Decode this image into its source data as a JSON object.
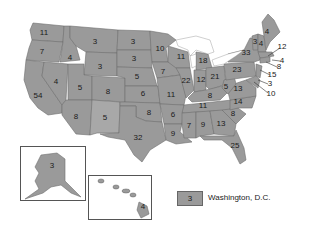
{
  "map": {
    "title": "",
    "type": "choropleth-number-labels",
    "fill_color": "#9a9a9a",
    "border_color": "#6e6e6e",
    "states": [
      {
        "name": "Washington",
        "value": "11",
        "x": 44,
        "y": 33
      },
      {
        "name": "Oregon",
        "value": "7",
        "x": 42,
        "y": 52
      },
      {
        "name": "California",
        "value": "54",
        "x": 38,
        "y": 96
      },
      {
        "name": "Idaho",
        "value": "4",
        "x": 70,
        "y": 58
      },
      {
        "name": "Nevada",
        "value": "4",
        "x": 56,
        "y": 82
      },
      {
        "name": "Montana",
        "value": "3",
        "x": 95,
        "y": 42
      },
      {
        "name": "Wyoming",
        "value": "3",
        "x": 100,
        "y": 67
      },
      {
        "name": "Utah",
        "value": "5",
        "x": 80,
        "y": 88
      },
      {
        "name": "Colorado",
        "value": "8",
        "x": 108,
        "y": 92
      },
      {
        "name": "Arizona",
        "value": "8",
        "x": 76,
        "y": 117
      },
      {
        "name": "New Mexico",
        "value": "5",
        "x": 105,
        "y": 118
      },
      {
        "name": "North Dakota",
        "value": "3",
        "x": 133,
        "y": 42
      },
      {
        "name": "South Dakota",
        "value": "3",
        "x": 134,
        "y": 59
      },
      {
        "name": "Nebraska",
        "value": "5",
        "x": 137,
        "y": 77
      },
      {
        "name": "Kansas",
        "value": "6",
        "x": 143,
        "y": 94
      },
      {
        "name": "Oklahoma",
        "value": "8",
        "x": 149,
        "y": 113
      },
      {
        "name": "Texas",
        "value": "32",
        "x": 138,
        "y": 138
      },
      {
        "name": "Minnesota",
        "value": "10",
        "x": 160,
        "y": 49
      },
      {
        "name": "Iowa",
        "value": "7",
        "x": 163,
        "y": 72
      },
      {
        "name": "Missouri",
        "value": "11",
        "x": 171,
        "y": 95
      },
      {
        "name": "Arkansas",
        "value": "6",
        "x": 173,
        "y": 115
      },
      {
        "name": "Louisiana",
        "value": "9",
        "x": 173,
        "y": 134
      },
      {
        "name": "Wisconsin",
        "value": "11",
        "x": 181,
        "y": 57
      },
      {
        "name": "Illinois",
        "value": "22",
        "x": 186,
        "y": 81
      },
      {
        "name": "Michigan",
        "value": "18",
        "x": 203,
        "y": 61
      },
      {
        "name": "Indiana",
        "value": "12",
        "x": 201,
        "y": 80
      },
      {
        "name": "Ohio",
        "value": "21",
        "x": 215,
        "y": 77
      },
      {
        "name": "Kentucky",
        "value": "8",
        "x": 210,
        "y": 96
      },
      {
        "name": "Tennessee",
        "value": "11",
        "x": 203,
        "y": 106
      },
      {
        "name": "Mississippi",
        "value": "7",
        "x": 189,
        "y": 126
      },
      {
        "name": "Alabama",
        "value": "9",
        "x": 203,
        "y": 125
      },
      {
        "name": "Georgia",
        "value": "13",
        "x": 221,
        "y": 124
      },
      {
        "name": "Florida",
        "value": "25",
        "x": 235,
        "y": 146
      },
      {
        "name": "South Carolina",
        "value": "8",
        "x": 233,
        "y": 114
      },
      {
        "name": "North Carolina",
        "value": "14",
        "x": 238,
        "y": 102
      },
      {
        "name": "Virginia",
        "value": "13",
        "x": 238,
        "y": 89
      },
      {
        "name": "West Virginia",
        "value": "5",
        "x": 226,
        "y": 87
      },
      {
        "name": "Pennsylvania",
        "value": "23",
        "x": 237,
        "y": 70
      },
      {
        "name": "New York",
        "value": "33",
        "x": 246,
        "y": 53
      },
      {
        "name": "Vermont",
        "value": "3",
        "x": 255,
        "y": 42
      },
      {
        "name": "New Hampshire",
        "value": "4",
        "x": 261,
        "y": 44
      },
      {
        "name": "Maine",
        "value": "4",
        "x": 267,
        "y": 32
      },
      {
        "name": "Alaska",
        "value": "3",
        "x": 52,
        "y": 166
      },
      {
        "name": "Hawaii",
        "value": "4",
        "x": 143,
        "y": 207
      }
    ],
    "callouts": [
      {
        "name": "Massachusetts",
        "value": "12",
        "x": 282,
        "y": 47
      },
      {
        "name": "Rhode Island",
        "value": "4",
        "x": 282,
        "y": 61
      },
      {
        "name": "Connecticut",
        "value": "8",
        "x": 279,
        "y": 67
      },
      {
        "name": "New Jersey",
        "value": "15",
        "x": 272,
        "y": 75
      },
      {
        "name": "Delaware",
        "value": "3",
        "x": 270,
        "y": 84
      },
      {
        "name": "Maryland",
        "value": "10",
        "x": 271,
        "y": 94
      }
    ]
  },
  "legend": {
    "swatch_value": "3",
    "label": "Washington, D.C."
  }
}
